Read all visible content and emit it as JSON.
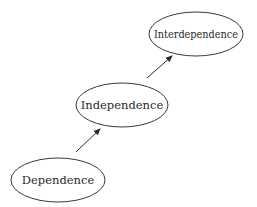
{
  "diagram": {
    "type": "progression",
    "nodes": [
      {
        "id": "dependence",
        "label": "Dependence",
        "cx": 58,
        "cy": 180,
        "rx": 47,
        "ry": 22
      },
      {
        "id": "independence",
        "label": "Independence",
        "cx": 122,
        "cy": 105,
        "rx": 46,
        "ry": 22
      },
      {
        "id": "interdependence",
        "label": "Interdependence",
        "cx": 196,
        "cy": 34,
        "rx": 47,
        "ry": 22
      }
    ],
    "edges": [
      {
        "from": "dependence",
        "to": "independence"
      },
      {
        "from": "independence",
        "to": "interdependence"
      }
    ],
    "colors": {
      "stroke": "#3a3a3a",
      "text": "#2a2a2a",
      "background": "#ffffff"
    }
  }
}
